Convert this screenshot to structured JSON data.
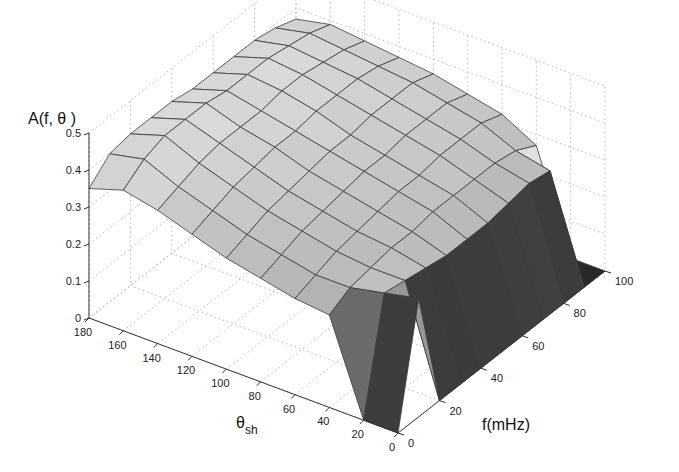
{
  "chart_data": {
    "type": "surface3d",
    "title": "",
    "zlabel": "A(f, θ )",
    "xlabel": "f(mHz)",
    "ylabel": "θ",
    "ylabel_sub": "sh",
    "zlim": [
      0,
      0.5
    ],
    "xlim": [
      0,
      100
    ],
    "ylim": [
      0,
      180
    ],
    "grid": true,
    "colormap": "gray",
    "z_ticks": [
      "0",
      "0.1",
      "0.2",
      "0.3",
      "0.4",
      "0.5"
    ],
    "f_ticks": [
      "0",
      "20",
      "40",
      "60",
      "80",
      "100"
    ],
    "theta_ticks": [
      "0",
      "20",
      "40",
      "60",
      "80",
      "100",
      "120",
      "140",
      "160",
      "180"
    ],
    "f": [
      0,
      10,
      20,
      30,
      40,
      50,
      60,
      70,
      80,
      90,
      100
    ],
    "theta": [
      0,
      20,
      40,
      60,
      80,
      100,
      120,
      140,
      160,
      180
    ],
    "A": [
      [
        0.0,
        0.32,
        0.0,
        0.0,
        0.0,
        0.0,
        0.0,
        0.0,
        0.0,
        0.0,
        0.0
      ],
      [
        0.0,
        0.3,
        0.29,
        0.28,
        0.27,
        0.27,
        0.27,
        0.28,
        0.29,
        0.28,
        0.0
      ],
      [
        0.25,
        0.28,
        0.29,
        0.3,
        0.3,
        0.31,
        0.31,
        0.31,
        0.31,
        0.3,
        0.27
      ],
      [
        0.26,
        0.28,
        0.3,
        0.31,
        0.32,
        0.33,
        0.33,
        0.34,
        0.34,
        0.34,
        0.32
      ],
      [
        0.28,
        0.3,
        0.32,
        0.33,
        0.34,
        0.35,
        0.35,
        0.36,
        0.36,
        0.36,
        0.34
      ],
      [
        0.3,
        0.32,
        0.34,
        0.35,
        0.36,
        0.37,
        0.37,
        0.38,
        0.38,
        0.38,
        0.36
      ],
      [
        0.33,
        0.35,
        0.37,
        0.38,
        0.39,
        0.39,
        0.4,
        0.4,
        0.4,
        0.39,
        0.37
      ],
      [
        0.36,
        0.38,
        0.4,
        0.41,
        0.41,
        0.41,
        0.42,
        0.42,
        0.41,
        0.4,
        0.38
      ],
      [
        0.38,
        0.42,
        0.44,
        0.44,
        0.44,
        0.43,
        0.43,
        0.43,
        0.42,
        0.41,
        0.39
      ],
      [
        0.35,
        0.4,
        0.41,
        0.41,
        0.41,
        0.4,
        0.4,
        0.4,
        0.4,
        0.39,
        0.37
      ]
    ]
  }
}
